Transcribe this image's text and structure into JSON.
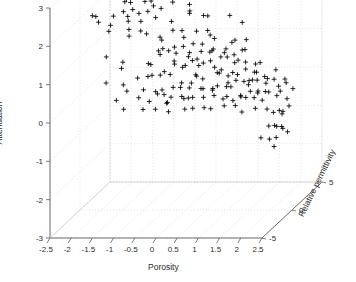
{
  "figure": {
    "kind": "matlab-3d-scatter",
    "background": "#ffffff",
    "marker_color": "#000000",
    "grid_color": "#d4d4d4",
    "axis_color": "#5a5a5a"
  },
  "axes": {
    "x": {
      "label": "Porosity",
      "ticks": [
        "-2.5",
        "-2",
        "-1.5",
        "-1",
        "-0.5",
        "0",
        "0.5",
        "1",
        "1.5",
        "2",
        "2.5"
      ],
      "range": [
        -2.5,
        2.5
      ]
    },
    "y": {
      "label": "Attenuation",
      "ticks": [
        "3",
        "2",
        "1",
        "0",
        "-1",
        "-2",
        "-3"
      ],
      "range": [
        -3,
        3
      ]
    },
    "z": {
      "label": "Relative permittivity",
      "ticks": [
        "5",
        "0",
        "-5"
      ],
      "range": [
        -5,
        5
      ]
    }
  },
  "chart_data": {
    "type": "scatter",
    "title": "",
    "xlabel": "Porosity",
    "ylabel": "Attenuation",
    "zlabel": "Relative permittivity",
    "xlim": [
      -2.5,
      2.5
    ],
    "ylim": [
      -3,
      3
    ],
    "zlim": [
      -5,
      5
    ],
    "grid": true,
    "legend": null,
    "marker": "+",
    "series": [
      {
        "name": "samples",
        "points": [
          [
            -2.02,
            2.62,
            1.4
          ],
          [
            -1.93,
            2.52,
            1.2
          ],
          [
            -1.86,
            2.9,
            0.6
          ],
          [
            -1.79,
            2.7,
            2.1
          ],
          [
            -1.74,
            2.98,
            1.0
          ],
          [
            -1.7,
            3.02,
            0.2
          ],
          [
            -1.66,
            2.86,
            2.4
          ],
          [
            -1.63,
            3.06,
            -0.4
          ],
          [
            -1.6,
            2.66,
            1.8
          ],
          [
            -1.57,
            2.3,
            0.9
          ],
          [
            -1.54,
            3.1,
            1.5
          ],
          [
            -1.52,
            2.42,
            2.7
          ],
          [
            -1.49,
            2.16,
            0.1
          ],
          [
            -1.47,
            2.74,
            -1.0
          ],
          [
            -1.44,
            2.04,
            1.3
          ],
          [
            -1.41,
            2.96,
            2.0
          ],
          [
            -1.38,
            2.34,
            0.5
          ],
          [
            -1.35,
            1.88,
            1.7
          ],
          [
            -1.32,
            2.58,
            -0.6
          ],
          [
            -1.28,
            2.12,
            2.2
          ],
          [
            -1.25,
            2.46,
            0.8
          ],
          [
            -1.22,
            1.76,
            1.1
          ],
          [
            -1.19,
            2.24,
            -1.3
          ],
          [
            -1.16,
            2.8,
            0.3
          ],
          [
            -1.12,
            1.96,
            2.5
          ],
          [
            -1.08,
            2.38,
            1.6
          ],
          [
            -1.04,
            1.7,
            -0.2
          ],
          [
            -1.0,
            2.08,
            0.7
          ],
          [
            -2.08,
            2.2,
            -0.9
          ],
          [
            -2.12,
            1.84,
            0.4
          ],
          [
            -1.98,
            1.78,
            1.9
          ],
          [
            -1.9,
            2.28,
            -1.6
          ],
          [
            -1.82,
            1.66,
            0.0
          ],
          [
            -1.76,
            2.44,
            2.8
          ],
          [
            -1.68,
            1.92,
            -0.7
          ],
          [
            -1.56,
            1.72,
            1.4
          ],
          [
            -1.43,
            1.62,
            0.6
          ],
          [
            -1.3,
            1.58,
            -0.3
          ],
          [
            -1.1,
            1.42,
            1.2
          ],
          [
            -0.95,
            2.32,
            0.9
          ],
          [
            -0.88,
            2.62,
            -0.5
          ],
          [
            -0.8,
            2.04,
            1.5
          ],
          [
            -0.72,
            2.36,
            2.3
          ],
          [
            -0.64,
            1.48,
            0.2
          ],
          [
            -0.56,
            2.18,
            -1.1
          ],
          [
            -0.48,
            2.74,
            1.0
          ],
          [
            -0.4,
            1.86,
            0.4
          ],
          [
            -0.3,
            2.26,
            2.6
          ],
          [
            -0.2,
            2.54,
            -0.8
          ],
          [
            -0.1,
            1.94,
            1.3
          ],
          [
            0.02,
            2.12,
            0.5
          ],
          [
            0.14,
            2.42,
            -0.4
          ],
          [
            0.26,
            1.8,
            1.8
          ],
          [
            0.4,
            2.06,
            0.1
          ],
          [
            0.56,
            2.58,
            2.0
          ],
          [
            0.74,
            1.74,
            -1.2
          ],
          [
            0.92,
            1.96,
            0.8
          ],
          [
            1.1,
            1.66,
            1.6
          ],
          [
            1.24,
            1.52,
            -0.6
          ],
          [
            1.38,
            1.4,
            0.3
          ],
          [
            -0.7,
            1.3,
            0.9
          ],
          [
            -0.62,
            1.18,
            -0.2
          ],
          [
            -0.55,
            1.44,
            1.7
          ],
          [
            -0.48,
            1.08,
            0.5
          ],
          [
            -0.42,
            1.34,
            -0.9
          ],
          [
            -0.36,
            0.96,
            2.1
          ],
          [
            -0.3,
            1.22,
            0.2
          ],
          [
            -0.25,
            1.52,
            1.1
          ],
          [
            -0.2,
            0.88,
            -0.5
          ],
          [
            -0.15,
            1.4,
            0.7
          ],
          [
            -0.1,
            1.06,
            1.9
          ],
          [
            -0.05,
            1.28,
            -1.3
          ],
          [
            0.0,
            0.94,
            0.4
          ],
          [
            0.05,
            1.46,
            1.4
          ],
          [
            0.1,
            1.12,
            -0.1
          ],
          [
            0.15,
            0.82,
            0.8
          ],
          [
            0.2,
            1.36,
            2.2
          ],
          [
            0.25,
            1.0,
            -0.7
          ],
          [
            0.3,
            1.24,
            0.6
          ],
          [
            0.35,
            0.9,
            1.5
          ],
          [
            0.4,
            1.18,
            -0.3
          ],
          [
            0.45,
            0.76,
            0.9
          ],
          [
            0.5,
            1.3,
            1.2
          ],
          [
            0.55,
            0.98,
            -1.0
          ],
          [
            0.6,
            1.14,
            0.1
          ],
          [
            0.65,
            0.84,
            1.8
          ],
          [
            0.7,
            1.26,
            -0.4
          ],
          [
            0.75,
            0.92,
            0.5
          ],
          [
            0.8,
            1.08,
            2.0
          ],
          [
            0.85,
            0.7,
            -0.8
          ],
          [
            0.9,
            1.16,
            0.3
          ],
          [
            0.95,
            0.86,
            1.3
          ],
          [
            1.0,
            1.02,
            -0.2
          ],
          [
            1.05,
            0.74,
            0.7
          ],
          [
            1.1,
            0.94,
            1.6
          ],
          [
            1.15,
            0.66,
            -1.1
          ],
          [
            1.2,
            0.88,
            0.2
          ],
          [
            1.25,
            1.04,
            1.0
          ],
          [
            1.3,
            0.62,
            -0.6
          ],
          [
            1.35,
            0.8,
            0.4
          ],
          [
            1.4,
            0.56,
            1.7
          ],
          [
            1.45,
            0.72,
            -0.3
          ],
          [
            1.5,
            0.48,
            0.8
          ],
          [
            1.55,
            0.64,
            1.4
          ],
          [
            1.6,
            0.4,
            -0.9
          ],
          [
            1.65,
            0.58,
            0.1
          ],
          [
            1.7,
            0.32,
            1.1
          ],
          [
            1.75,
            0.46,
            -0.5
          ],
          [
            1.8,
            0.22,
            0.6
          ],
          [
            1.85,
            0.38,
            1.9
          ],
          [
            1.9,
            0.12,
            -0.2
          ],
          [
            1.95,
            0.28,
            0.9
          ],
          [
            2.0,
            0.04,
            1.3
          ],
          [
            2.05,
            0.18,
            -0.7
          ],
          [
            2.1,
            -0.06,
            0.3
          ],
          [
            2.15,
            0.1,
            1.5
          ],
          [
            -0.9,
            0.72,
            0.5
          ],
          [
            -0.84,
            0.54,
            -0.4
          ],
          [
            -0.78,
            0.88,
            1.2
          ],
          [
            -0.72,
            0.4,
            0.8
          ],
          [
            -0.66,
            0.66,
            -1.0
          ],
          [
            -0.6,
            0.3,
            1.6
          ],
          [
            -0.54,
            0.58,
            0.2
          ],
          [
            -0.48,
            0.22,
            -0.6
          ],
          [
            -0.42,
            0.74,
            1.0
          ],
          [
            -0.36,
            0.14,
            0.4
          ],
          [
            -0.3,
            0.48,
            2.0
          ],
          [
            -0.24,
            0.06,
            -0.8
          ],
          [
            -0.18,
            0.62,
            0.7
          ],
          [
            -0.12,
            -0.02,
            1.4
          ],
          [
            -0.06,
            0.36,
            -0.3
          ],
          [
            0.0,
            0.18,
            0.9
          ],
          [
            0.06,
            0.52,
            1.7
          ],
          [
            0.12,
            0.08,
            -1.2
          ],
          [
            0.18,
            0.42,
            0.5
          ],
          [
            0.24,
            0.26,
            1.1
          ],
          [
            0.3,
            0.6,
            -0.5
          ],
          [
            0.36,
            0.12,
            0.3
          ],
          [
            0.42,
            0.46,
            1.8
          ],
          [
            0.48,
            0.3,
            -0.9
          ],
          [
            0.54,
            0.04,
            0.6
          ],
          [
            0.6,
            0.38,
            1.3
          ],
          [
            0.66,
            0.2,
            -0.2
          ],
          [
            0.72,
            0.54,
            0.8
          ],
          [
            0.78,
            0.1,
            1.5
          ],
          [
            0.84,
            0.34,
            -0.7
          ],
          [
            0.9,
            0.16,
            0.4
          ],
          [
            0.96,
            0.44,
            1.0
          ],
          [
            1.02,
            0.02,
            -0.4
          ],
          [
            1.08,
            0.28,
            0.7
          ],
          [
            1.14,
            0.12,
            1.6
          ],
          [
            1.2,
            0.36,
            -1.0
          ],
          [
            1.26,
            -0.04,
            0.2
          ],
          [
            1.32,
            0.2,
            1.2
          ],
          [
            1.38,
            0.04,
            -0.6
          ],
          [
            1.44,
            0.26,
            0.9
          ],
          [
            1.5,
            -0.1,
            1.4
          ],
          [
            1.56,
            0.14,
            -0.3
          ],
          [
            1.62,
            -0.02,
            0.5
          ],
          [
            1.68,
            0.18,
            1.7
          ],
          [
            -0.8,
            0.0,
            0.6
          ],
          [
            -0.7,
            -0.18,
            1.3
          ],
          [
            -0.6,
            0.1,
            -0.5
          ],
          [
            -0.5,
            -0.26,
            0.3
          ],
          [
            -0.4,
            -0.08,
            1.9
          ],
          [
            -0.3,
            -0.32,
            -0.8
          ],
          [
            -0.2,
            -0.14,
            0.7
          ],
          [
            -0.1,
            -0.24,
            1.1
          ],
          [
            0.0,
            -0.34,
            -0.2
          ],
          [
            0.1,
            -0.12,
            0.4
          ],
          [
            0.2,
            -0.28,
            1.5
          ],
          [
            0.3,
            -0.2,
            -1.0
          ],
          [
            0.4,
            -0.36,
            0.2
          ],
          [
            0.52,
            -0.16,
            1.0
          ],
          [
            0.64,
            -0.3,
            -0.4
          ],
          [
            0.76,
            -0.22,
            0.8
          ],
          [
            0.88,
            -0.38,
            1.6
          ],
          [
            1.0,
            -0.18,
            -0.7
          ],
          [
            1.12,
            -0.32,
            0.3
          ],
          [
            1.24,
            -0.24,
            1.2
          ],
          [
            1.36,
            -0.4,
            -0.3
          ],
          [
            1.48,
            -0.2,
            0.9
          ],
          [
            1.6,
            -0.34,
            1.4
          ],
          [
            1.72,
            -0.26,
            -0.6
          ],
          [
            1.84,
            -0.44,
            0.5
          ],
          [
            1.92,
            -0.6,
            1.0
          ],
          [
            1.98,
            -0.78,
            -0.2
          ],
          [
            2.04,
            -0.92,
            0.7
          ],
          [
            2.1,
            -1.06,
            1.3
          ],
          [
            2.16,
            -0.72,
            -0.5
          ],
          [
            2.2,
            -0.88,
            0.4
          ],
          [
            2.24,
            -1.12,
            1.1
          ],
          [
            1.88,
            -1.0,
            -0.8
          ],
          [
            1.94,
            -1.18,
            0.2
          ],
          [
            2.0,
            -1.24,
            0.9
          ],
          [
            2.06,
            -0.66,
            1.6
          ],
          [
            2.12,
            -1.3,
            -0.3
          ],
          [
            2.18,
            -0.58,
            0.6
          ],
          [
            2.26,
            -0.46,
            1.2
          ],
          [
            2.3,
            -0.3,
            -0.7
          ],
          [
            2.34,
            -0.14,
            0.3
          ],
          [
            2.38,
            0.02,
            1.0
          ],
          [
            2.28,
            0.16,
            -0.4
          ],
          [
            2.22,
            0.3,
            0.8
          ],
          [
            -1.95,
            0.92,
            0.5
          ],
          [
            -1.8,
            0.4,
            -0.6
          ],
          [
            -1.66,
            0.68,
            1.2
          ],
          [
            -1.52,
            0.22,
            0.3
          ],
          [
            -1.38,
            0.84,
            -1.0
          ],
          [
            -1.24,
            0.34,
            0.7
          ],
          [
            -1.1,
            0.6,
            1.5
          ],
          [
            -0.96,
            0.18,
            -0.3
          ],
          [
            -1.7,
            -0.2,
            0.4
          ],
          [
            -1.55,
            -0.06,
            1.1
          ],
          [
            -1.4,
            -0.3,
            -0.5
          ],
          [
            -1.2,
            -0.16,
            0.6
          ],
          [
            -1.05,
            -0.36,
            1.3
          ],
          [
            -0.9,
            -0.26,
            -0.8
          ],
          [
            -0.75,
            -0.4,
            0.2
          ],
          [
            -0.58,
            -0.34,
            1.0
          ]
        ]
      }
    ]
  }
}
